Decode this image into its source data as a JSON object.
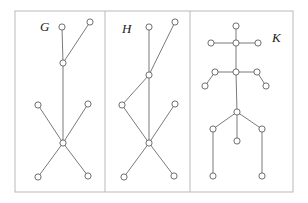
{
  "figure": {
    "background_color": "#ffffff",
    "frame_color": "#b9b9b9",
    "edge_color": "#6b6b6b",
    "vertex_fill": "#ffffff",
    "vertex_stroke": "#5f5f5f",
    "vertex_radius": 3.1
  },
  "frame": {
    "x": 15,
    "y": 11,
    "width": 278,
    "height": 181
  },
  "dividers": [
    {
      "name": "divider-g-h",
      "x": 105,
      "y1": 11,
      "y2": 192
    },
    {
      "name": "divider-h-k",
      "x": 190,
      "y1": 11,
      "y2": 192
    }
  ],
  "panels": [
    {
      "id": "G",
      "label": "G",
      "label_x": 40,
      "label_y": 31,
      "vertices": [
        {
          "id": "g1",
          "x": 62,
          "y": 27
        },
        {
          "id": "g2",
          "x": 90,
          "y": 22
        },
        {
          "id": "g3",
          "x": 63,
          "y": 63
        },
        {
          "id": "g4",
          "x": 38,
          "y": 105
        },
        {
          "id": "g5",
          "x": 88,
          "y": 104
        },
        {
          "id": "g6",
          "x": 63,
          "y": 143
        },
        {
          "id": "g7",
          "x": 38,
          "y": 177
        },
        {
          "id": "g8",
          "x": 88,
          "y": 176
        }
      ],
      "edges": [
        [
          "g1",
          "g3"
        ],
        [
          "g2",
          "g3"
        ],
        [
          "g3",
          "g6"
        ],
        [
          "g4",
          "g6"
        ],
        [
          "g5",
          "g6"
        ],
        [
          "g6",
          "g7"
        ],
        [
          "g6",
          "g8"
        ]
      ]
    },
    {
      "id": "H",
      "label": "H",
      "label_x": 122,
      "label_y": 33,
      "vertices": [
        {
          "id": "h1",
          "x": 149,
          "y": 27
        },
        {
          "id": "h2",
          "x": 175,
          "y": 22
        },
        {
          "id": "h3",
          "x": 149,
          "y": 75
        },
        {
          "id": "h4",
          "x": 122,
          "y": 105
        },
        {
          "id": "h5",
          "x": 175,
          "y": 104
        },
        {
          "id": "h6",
          "x": 149,
          "y": 143
        },
        {
          "id": "h7",
          "x": 124,
          "y": 177
        },
        {
          "id": "h8",
          "x": 174,
          "y": 176
        }
      ],
      "edges": [
        [
          "h1",
          "h3"
        ],
        [
          "h2",
          "h3"
        ],
        [
          "h3",
          "h4"
        ],
        [
          "h3",
          "h6"
        ],
        [
          "h4",
          "h6"
        ],
        [
          "h5",
          "h6"
        ],
        [
          "h6",
          "h7"
        ],
        [
          "h6",
          "h8"
        ]
      ]
    },
    {
      "id": "K",
      "label": "K",
      "label_x": 272,
      "label_y": 42,
      "vertices": [
        {
          "id": "k1",
          "x": 236,
          "y": 26
        },
        {
          "id": "k2",
          "x": 211,
          "y": 43
        },
        {
          "id": "k3",
          "x": 236,
          "y": 43
        },
        {
          "id": "k4",
          "x": 258,
          "y": 43
        },
        {
          "id": "k5",
          "x": 215,
          "y": 72
        },
        {
          "id": "k6",
          "x": 236,
          "y": 72
        },
        {
          "id": "k7",
          "x": 257,
          "y": 72
        },
        {
          "id": "k8",
          "x": 205,
          "y": 86
        },
        {
          "id": "k9",
          "x": 266,
          "y": 86
        },
        {
          "id": "k10",
          "x": 237,
          "y": 112
        },
        {
          "id": "k11",
          "x": 213,
          "y": 129
        },
        {
          "id": "k12",
          "x": 237,
          "y": 141
        },
        {
          "id": "k13",
          "x": 262,
          "y": 129
        },
        {
          "id": "k14",
          "x": 213,
          "y": 176
        },
        {
          "id": "k15",
          "x": 262,
          "y": 176
        }
      ],
      "edges": [
        [
          "k1",
          "k3"
        ],
        [
          "k2",
          "k3"
        ],
        [
          "k3",
          "k4"
        ],
        [
          "k3",
          "k6"
        ],
        [
          "k5",
          "k6"
        ],
        [
          "k6",
          "k7"
        ],
        [
          "k5",
          "k8"
        ],
        [
          "k7",
          "k9"
        ],
        [
          "k6",
          "k10"
        ],
        [
          "k10",
          "k11"
        ],
        [
          "k10",
          "k12"
        ],
        [
          "k10",
          "k13"
        ],
        [
          "k11",
          "k14"
        ],
        [
          "k13",
          "k15"
        ]
      ]
    }
  ]
}
